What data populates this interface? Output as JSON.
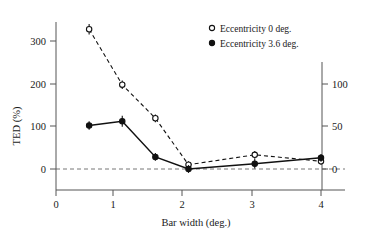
{
  "chart_data": {
    "type": "line",
    "title": "",
    "xlabel": "Bar width (deg.)",
    "ylabel": "TED (%)",
    "xlim": [
      0,
      4.45
    ],
    "ylim": [
      -30,
      345
    ],
    "xticks": [
      0,
      1,
      2,
      3,
      4
    ],
    "xticklabels": [
      "0",
      "1",
      "2",
      "3",
      "4"
    ],
    "yticks": [
      0,
      100,
      200,
      300
    ],
    "yticklabels": [
      "0",
      "100",
      "200",
      "300"
    ],
    "secondary_axis": {
      "position": "right",
      "ticks": [
        0,
        50,
        100
      ],
      "ticklabels": [
        "0",
        "50",
        "100"
      ],
      "scale_relative_to_left": 2.0
    },
    "grid": false,
    "zero_reference_line": true,
    "legend_position": "top-right",
    "series": [
      {
        "name": "Eccentricity 0 deg.",
        "marker": "open-circle",
        "linestyle": "dashed",
        "x": [
          0.5,
          1.0,
          1.5,
          2.0,
          3.0,
          4.0
        ],
        "values": [
          325,
          196,
          118,
          10,
          33,
          18
        ],
        "errors": [
          12,
          10,
          9,
          8,
          9,
          8
        ]
      },
      {
        "name": "Eccentricity 3.6 deg.",
        "marker": "filled-circle",
        "linestyle": "solid",
        "x": [
          0.5,
          1.0,
          1.5,
          2.0,
          3.0,
          4.0
        ],
        "values": [
          101,
          111,
          28,
          0,
          12,
          26
        ],
        "errors": [
          10,
          13,
          9,
          9,
          11,
          9
        ]
      }
    ]
  },
  "legend": {
    "items": [
      {
        "label": "Eccentricity 0 deg.",
        "marker": "open-circle"
      },
      {
        "label": "Eccentricity 3.6 deg.",
        "marker": "filled-circle"
      }
    ]
  },
  "axes": {
    "y_left_title": "TED (%)",
    "x_title": "Bar width (deg.)"
  }
}
